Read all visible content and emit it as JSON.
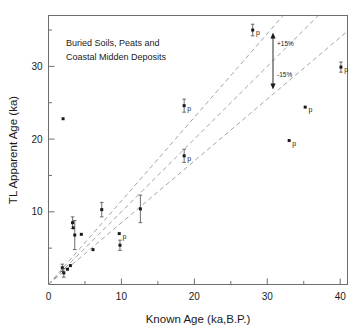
{
  "chart_data": {
    "type": "scatter",
    "title": "Buried Soils, Peats and Coastal Midden Deposits",
    "title_line1": "Buried Soils, Peats and",
    "title_line2": "Coastal Midden Deposits",
    "xlabel": "Known Age  (ka,B.P.)",
    "ylabel": "TL Apparent Age (ka)",
    "xlim": [
      0,
      41
    ],
    "ylim": [
      0,
      37
    ],
    "grid": false,
    "legend": "none",
    "xticks": [
      0,
      10,
      20,
      30,
      40
    ],
    "xtick_labels": [
      "0",
      "10",
      "20",
      "30",
      "40"
    ],
    "xminor": [
      5,
      15,
      25,
      35
    ],
    "yticks": [
      10,
      20,
      30
    ],
    "ytick_labels": [
      "10",
      "20",
      "30"
    ],
    "yminor": [
      5,
      15,
      25,
      35
    ],
    "reference_lines": [
      {
        "name": "one-to-one",
        "slope": 1.0,
        "label": ""
      },
      {
        "name": "plus-15-percent",
        "slope": 1.15,
        "label": "+15%"
      },
      {
        "name": "minus-15-percent",
        "slope": 0.85,
        "label": "-15%"
      }
    ],
    "annotations": [
      {
        "name": "plus-15-label",
        "text": "+15%",
        "x": 31.2,
        "y": 31.5
      },
      {
        "name": "minus-15-label",
        "text": "-15%",
        "x": 31.2,
        "y": 27.2
      },
      {
        "name": "error-span-arrow",
        "text": "",
        "x": 30,
        "y_top": 33.2,
        "y_bottom": 25.6
      }
    ],
    "point_label": "p",
    "points": [
      {
        "x": 2.0,
        "y": 22.8,
        "yerr": 0.0,
        "label": ""
      },
      {
        "x": 1.9,
        "y": 2.3,
        "yerr": 0.5,
        "label": ""
      },
      {
        "x": 2.1,
        "y": 1.6,
        "yerr": 0.6,
        "label": ""
      },
      {
        "x": 2.6,
        "y": 2.1,
        "yerr": 0.0,
        "label": ""
      },
      {
        "x": 3.0,
        "y": 2.6,
        "yerr": 0.0,
        "label": ""
      },
      {
        "x": 3.3,
        "y": 8.5,
        "yerr": 0.8,
        "label": ""
      },
      {
        "x": 3.4,
        "y": 7.8,
        "yerr": 0.0,
        "label": ""
      },
      {
        "x": 3.6,
        "y": 6.8,
        "yerr": 2.0,
        "label": ""
      },
      {
        "x": 4.5,
        "y": 6.9,
        "yerr": 0.0,
        "label": ""
      },
      {
        "x": 6.1,
        "y": 4.8,
        "yerr": 0.0,
        "label": ""
      },
      {
        "x": 7.3,
        "y": 10.3,
        "yerr": 1.0,
        "label": ""
      },
      {
        "x": 9.7,
        "y": 7.0,
        "yerr": 0.0,
        "label": "p"
      },
      {
        "x": 9.8,
        "y": 5.4,
        "yerr": 0.7,
        "label": ""
      },
      {
        "x": 12.6,
        "y": 10.4,
        "yerr": 1.9,
        "label": ""
      },
      {
        "x": 18.6,
        "y": 17.7,
        "yerr": 0.9,
        "label": "p"
      },
      {
        "x": 18.6,
        "y": 24.6,
        "yerr": 0.9,
        "label": "p"
      },
      {
        "x": 28.0,
        "y": 35.0,
        "yerr": 0.8,
        "label": "p"
      },
      {
        "x": 33.0,
        "y": 19.8,
        "yerr": 0.0,
        "label": "p"
      },
      {
        "x": 35.2,
        "y": 24.4,
        "yerr": 0.0,
        "label": "p"
      },
      {
        "x": 40.1,
        "y": 29.9,
        "yerr": 0.7,
        "label": "p"
      }
    ]
  }
}
